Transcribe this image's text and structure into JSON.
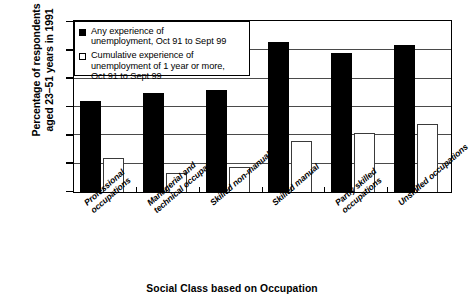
{
  "chart_data": {
    "type": "bar",
    "title": "",
    "xlabel": "Social Class based on Occupation",
    "ylabel": "Percentage of respondents\naged 23–51 years in 1991",
    "ylim": [
      0,
      30
    ],
    "yticks": [
      0,
      5,
      10,
      15,
      20,
      25,
      30
    ],
    "ytick_labels": [
      "0",
      "5",
      "10",
      "15",
      "20",
      "25",
      "30"
    ],
    "grid": true,
    "legend_position": "top-left",
    "categories": [
      "Professional\noccupations",
      "Managerial and\ntechnical occupations",
      "Skilled non-manual",
      "Skilled manual",
      "Partly skilled\noccupations",
      "Unskilled occupations"
    ],
    "series": [
      {
        "name": "Any experience of\nunemployment, Oct 91 to Sept 99",
        "style": "solid-black",
        "color": "#000000",
        "values": [
          16,
          17.5,
          18,
          26.5,
          24.5,
          26
        ]
      },
      {
        "name": "Cumulative experience of\nunemployment of 1 year or more,\nOct 91 to Sept 99",
        "style": "hollow-white",
        "color": "#ffffff",
        "values": [
          6,
          3.3,
          4.4,
          9,
          10.5,
          12
        ]
      }
    ]
  },
  "legend": {
    "entries": [
      {
        "swatch": "filled-square",
        "label": "Any experience of\nunemployment, Oct 91 to Sept 99"
      },
      {
        "swatch": "empty-square",
        "label": "Cumulative experience of\nunemployment of 1 year or more,\nOct 91 to Sept 99"
      }
    ]
  }
}
